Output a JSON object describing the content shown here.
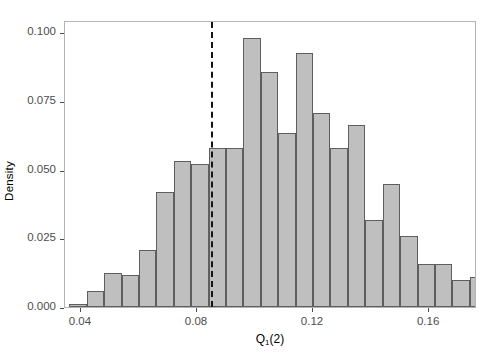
{
  "chart_data": {
    "type": "bar",
    "title": "",
    "subtitle": "",
    "xlabel": "Q₁(2)",
    "xlabel_base": "Q",
    "xlabel_sub": "1",
    "xlabel_tail": "(2)",
    "ylabel": "Density",
    "xlim": [
      0.0345,
      0.1765
    ],
    "ylim": [
      0.0,
      0.1045
    ],
    "grid": false,
    "legend": null,
    "bin_width": 0.006,
    "bar_fill": "#bfbfbf",
    "bar_edge": "#5e5e5e",
    "panel_border": "#b4b4b4",
    "xticks": [
      0.04,
      0.08,
      0.12,
      0.16
    ],
    "xtick_labels": [
      "0.04",
      "0.08",
      "0.12",
      "0.16"
    ],
    "yticks": [
      0.0,
      0.025,
      0.05,
      0.075,
      0.1
    ],
    "ytick_labels": [
      "0.000",
      "0.025",
      "0.050",
      "0.075",
      "0.100"
    ],
    "annotations": [
      {
        "name": "reference-dashed-line",
        "type": "vline",
        "x": 0.0848,
        "style": "dashed",
        "color": "#141414",
        "width": 2.2
      }
    ],
    "bin_edges": [
      0.036,
      0.042,
      0.048,
      0.054,
      0.06,
      0.066,
      0.072,
      0.078,
      0.084,
      0.09,
      0.096,
      0.102,
      0.108,
      0.114,
      0.12,
      0.126,
      0.132,
      0.138,
      0.144,
      0.15,
      0.156,
      0.162,
      0.168
    ],
    "bars": [
      {
        "x0": 0.036,
        "x1": 0.042,
        "value": 0.001
      },
      {
        "x0": 0.042,
        "x1": 0.048,
        "value": 0.006
      },
      {
        "x0": 0.048,
        "x1": 0.054,
        "value": 0.0125
      },
      {
        "x0": 0.054,
        "x1": 0.06,
        "value": 0.0115
      },
      {
        "x0": 0.06,
        "x1": 0.066,
        "value": 0.0207
      },
      {
        "x0": 0.066,
        "x1": 0.072,
        "value": 0.0417
      },
      {
        "x0": 0.072,
        "x1": 0.078,
        "value": 0.053
      },
      {
        "x0": 0.078,
        "x1": 0.084,
        "value": 0.0522
      },
      {
        "x0": 0.084,
        "x1": 0.09,
        "value": 0.0578
      },
      {
        "x0": 0.09,
        "x1": 0.096,
        "value": 0.0578
      },
      {
        "x0": 0.096,
        "x1": 0.102,
        "value": 0.098
      },
      {
        "x0": 0.102,
        "x1": 0.108,
        "value": 0.0855
      },
      {
        "x0": 0.108,
        "x1": 0.114,
        "value": 0.0633
      },
      {
        "x0": 0.114,
        "x1": 0.12,
        "value": 0.0925
      },
      {
        "x0": 0.12,
        "x1": 0.126,
        "value": 0.0705
      },
      {
        "x0": 0.126,
        "x1": 0.132,
        "value": 0.0578
      },
      {
        "x0": 0.132,
        "x1": 0.138,
        "value": 0.0663
      },
      {
        "x0": 0.138,
        "x1": 0.144,
        "value": 0.0318
      },
      {
        "x0": 0.144,
        "x1": 0.15,
        "value": 0.0448
      },
      {
        "x0": 0.15,
        "x1": 0.156,
        "value": 0.026
      },
      {
        "x0": 0.156,
        "x1": 0.162,
        "value": 0.0158
      },
      {
        "x0": 0.162,
        "x1": 0.168,
        "value": 0.0158
      },
      {
        "x0": 0.168,
        "x1": 0.174,
        "value": 0.0098
      },
      {
        "x0": 0.174,
        "x1": 0.18,
        "value": 0.011
      },
      {
        "x0": 0.18,
        "x1": 0.186,
        "value": 0.007
      },
      {
        "x0": 0.186,
        "x1": 0.192,
        "value": 0.003
      },
      {
        "x0": 0.192,
        "x1": 0.198,
        "value": 0.0
      },
      {
        "x0": 0.198,
        "x1": 0.204,
        "value": 0.004
      },
      {
        "x0": 0.204,
        "x1": 0.21,
        "value": 0.003
      }
    ]
  }
}
